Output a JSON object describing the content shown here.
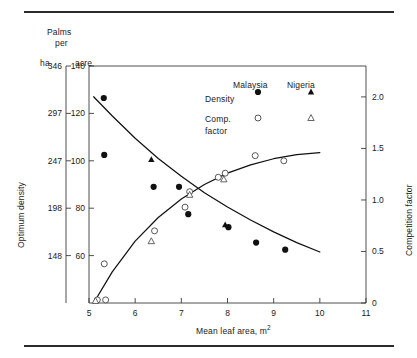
{
  "figure": {
    "top_rule": true,
    "bottom_rule": true
  },
  "chart_data": {
    "type": "scatter",
    "title": "",
    "xlabel": "Mean leaf area, m²",
    "ylabel": "Optimum density",
    "y2label": "Competition factor",
    "header_left": "Palms",
    "header_left2": "per",
    "unit_left_outer": "ha",
    "unit_left_inner": "acre",
    "xlim": [
      5,
      11
    ],
    "xticks": [
      5,
      6,
      7,
      8,
      9,
      10,
      11
    ],
    "xticklabels": [
      "5",
      "6",
      "7",
      "8",
      "9",
      "10",
      "11"
    ],
    "ylim_acre": [
      40,
      140
    ],
    "yticks_acre": [
      60,
      80,
      100,
      120,
      140
    ],
    "yticklabels_acre": [
      "60",
      "80",
      "100",
      "120",
      "140"
    ],
    "yticks_ha": [
      148,
      198,
      247,
      297,
      346
    ],
    "yticklabels_ha": [
      "148",
      "198",
      "247",
      "297",
      "346"
    ],
    "ylim2": [
      0,
      2.3
    ],
    "yticks2": [
      0,
      0.5,
      1.0,
      1.5,
      2.0
    ],
    "yticklabels2": [
      "0",
      "0.5",
      "1.0",
      "1.5",
      "2.0"
    ],
    "grid": false,
    "legend_position": "upper-right-inside",
    "legend": {
      "col_headers": [
        "Malaysia",
        "Nigeria"
      ],
      "rows": [
        {
          "label": "Density",
          "malaysia_marker": "filled-circle",
          "nigeria_marker": "filled-triangle"
        },
        {
          "label": "Comp.",
          "label2": "factor",
          "malaysia_marker": "open-circle",
          "nigeria_marker": "open-triangle"
        }
      ]
    },
    "series": [
      {
        "name": "Density Malaysia",
        "marker": "filled-circle",
        "axis": "left",
        "points": [
          {
            "x": 5.32,
            "y": 126.5
          },
          {
            "x": 5.33,
            "y": 102.5
          },
          {
            "x": 6.4,
            "y": 89.0
          },
          {
            "x": 6.95,
            "y": 89.0
          },
          {
            "x": 7.15,
            "y": 77.5
          },
          {
            "x": 8.02,
            "y": 72.0
          },
          {
            "x": 8.62,
            "y": 65.5
          },
          {
            "x": 9.25,
            "y": 62.5
          }
        ]
      },
      {
        "name": "Density Nigeria",
        "marker": "filled-triangle",
        "axis": "left",
        "points": [
          {
            "x": 6.35,
            "y": 100.5
          },
          {
            "x": 7.95,
            "y": 73.0
          }
        ]
      },
      {
        "name": "Comp. factor Malaysia",
        "marker": "open-circle",
        "axis": "right",
        "points": [
          {
            "x": 5.18,
            "y": 0.03
          },
          {
            "x": 5.36,
            "y": 0.03
          },
          {
            "x": 5.33,
            "y": 0.38
          },
          {
            "x": 6.42,
            "y": 0.7
          },
          {
            "x": 7.08,
            "y": 0.93
          },
          {
            "x": 7.18,
            "y": 1.08
          },
          {
            "x": 7.8,
            "y": 1.22
          },
          {
            "x": 7.95,
            "y": 1.26
          },
          {
            "x": 8.6,
            "y": 1.43
          },
          {
            "x": 9.22,
            "y": 1.38
          }
        ]
      },
      {
        "name": "Comp. factor Nigeria",
        "marker": "open-triangle",
        "axis": "right",
        "points": [
          {
            "x": 5.14,
            "y": 0.02
          },
          {
            "x": 6.35,
            "y": 0.6
          },
          {
            "x": 7.18,
            "y": 1.05
          },
          {
            "x": 7.92,
            "y": 1.2
          }
        ]
      }
    ],
    "curves": [
      {
        "name": "density-fit",
        "axis": "left",
        "points": [
          {
            "x": 5.1,
            "y": 127.0
          },
          {
            "x": 5.5,
            "y": 119.0
          },
          {
            "x": 6.0,
            "y": 109.5
          },
          {
            "x": 6.5,
            "y": 101.0
          },
          {
            "x": 7.0,
            "y": 93.5
          },
          {
            "x": 7.5,
            "y": 86.5
          },
          {
            "x": 8.0,
            "y": 80.5
          },
          {
            "x": 8.5,
            "y": 75.0
          },
          {
            "x": 9.0,
            "y": 70.0
          },
          {
            "x": 9.5,
            "y": 65.5
          },
          {
            "x": 10.0,
            "y": 61.5
          }
        ]
      },
      {
        "name": "competition-fit",
        "axis": "right",
        "points": [
          {
            "x": 5.1,
            "y": 0.0
          },
          {
            "x": 5.5,
            "y": 0.3
          },
          {
            "x": 6.0,
            "y": 0.6
          },
          {
            "x": 6.5,
            "y": 0.83
          },
          {
            "x": 7.0,
            "y": 1.01
          },
          {
            "x": 7.5,
            "y": 1.15
          },
          {
            "x": 8.0,
            "y": 1.26
          },
          {
            "x": 8.5,
            "y": 1.34
          },
          {
            "x": 9.0,
            "y": 1.4
          },
          {
            "x": 9.5,
            "y": 1.44
          },
          {
            "x": 10.0,
            "y": 1.46
          }
        ]
      }
    ]
  }
}
